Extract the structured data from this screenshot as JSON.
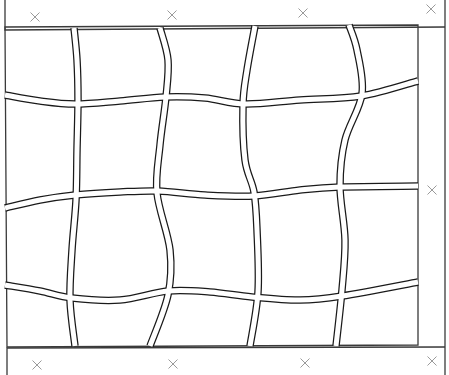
{
  "diagram": {
    "type": "mesh-warp-grid",
    "colors": {
      "line": "#1a1a1a",
      "frame": "#3a3a3a",
      "handle": "#9a9a9a",
      "background": "#ffffff"
    },
    "frame": {
      "top_strip": [
        [
          5,
          0
        ],
        [
          5,
          30
        ],
        [
          445,
          27
        ]
      ],
      "right_edge": [
        [
          445,
          0
        ],
        [
          445,
          375
        ]
      ],
      "bottom_strip": [
        [
          7,
          375
        ],
        [
          7,
          348
        ],
        [
          445,
          347
        ]
      ],
      "inner_rect": [
        [
          5,
          27
        ],
        [
          418,
          25
        ],
        [
          418,
          345
        ],
        [
          7,
          347
        ]
      ]
    },
    "vertical_lines": [
      {
        "id": "v1",
        "points": [
          [
            74,
            28
          ],
          [
            77,
            60
          ],
          [
            78,
            100
          ],
          [
            77,
            150
          ],
          [
            76,
            200
          ],
          [
            72,
            250
          ],
          [
            70,
            300
          ],
          [
            75,
            346
          ]
        ]
      },
      {
        "id": "v2",
        "points": [
          [
            160,
            28
          ],
          [
            168,
            60
          ],
          [
            166,
            97
          ],
          [
            160,
            145
          ],
          [
            157,
            193
          ],
          [
            170,
            250
          ],
          [
            168,
            295
          ],
          [
            150,
            346
          ]
        ]
      },
      {
        "id": "v3",
        "points": [
          [
            255,
            26
          ],
          [
            247,
            70
          ],
          [
            243,
            105
          ],
          [
            245,
            160
          ],
          [
            254,
            192
          ],
          [
            257,
            230
          ],
          [
            258,
            292
          ],
          [
            250,
            346
          ]
        ]
      },
      {
        "id": "v4",
        "points": [
          [
            349,
            25
          ],
          [
            357,
            50
          ],
          [
            362,
            94
          ],
          [
            345,
            140
          ],
          [
            340,
            186
          ],
          [
            345,
            240
          ],
          [
            342,
            290
          ],
          [
            336,
            346
          ]
        ]
      }
    ],
    "horizontal_lines": [
      {
        "id": "h1",
        "points": [
          [
            5,
            95
          ],
          [
            40,
            101
          ],
          [
            75,
            104
          ],
          [
            120,
            101
          ],
          [
            165,
            97
          ],
          [
            205,
            98
          ],
          [
            245,
            104
          ],
          [
            300,
            100
          ],
          [
            361,
            96
          ],
          [
            418,
            81
          ]
        ]
      },
      {
        "id": "h2",
        "points": [
          [
            5,
            208
          ],
          [
            40,
            200
          ],
          [
            75,
            195
          ],
          [
            120,
            192
          ],
          [
            158,
            191
          ],
          [
            205,
            195
          ],
          [
            254,
            196
          ],
          [
            300,
            190
          ],
          [
            340,
            187
          ],
          [
            418,
            186
          ]
        ]
      },
      {
        "id": "h3",
        "points": [
          [
            5,
            285
          ],
          [
            40,
            291
          ],
          [
            72,
            298
          ],
          [
            120,
            300
          ],
          [
            168,
            291
          ],
          [
            210,
            292
          ],
          [
            252,
            297
          ],
          [
            300,
            300
          ],
          [
            342,
            296
          ],
          [
            418,
            282
          ]
        ]
      }
    ],
    "handles": [
      {
        "id": "top-1",
        "x": 35,
        "y": 17
      },
      {
        "id": "top-2",
        "x": 172,
        "y": 15
      },
      {
        "id": "top-3",
        "x": 303,
        "y": 13
      },
      {
        "id": "top-4",
        "x": 431,
        "y": 9
      },
      {
        "id": "right-mid",
        "x": 432,
        "y": 190
      },
      {
        "id": "bottom-1",
        "x": 37,
        "y": 365
      },
      {
        "id": "bottom-2",
        "x": 173,
        "y": 364
      },
      {
        "id": "bottom-3",
        "x": 305,
        "y": 363
      },
      {
        "id": "bottom-4",
        "x": 432,
        "y": 361
      }
    ]
  }
}
